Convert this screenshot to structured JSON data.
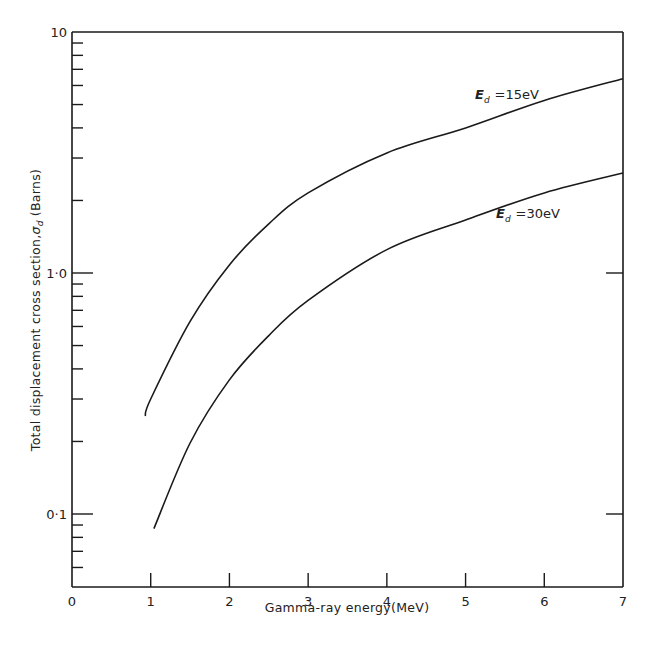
{
  "chart_data": {
    "type": "line",
    "title": "",
    "xlabel": "Gamma-ray energy(MeV)",
    "ylabel": "Total displacement cross section, σd (Barns)",
    "yscale": "log",
    "xlim": [
      0,
      7
    ],
    "ylim": [
      0.05,
      10
    ],
    "grid": false,
    "legend_position": "inline labels near curves (upper right)",
    "x_ticks": [
      "0",
      "1",
      "2",
      "3",
      "4",
      "5",
      "6",
      "7"
    ],
    "y_ticks": [
      "0·1",
      "1·0",
      "10"
    ],
    "series": [
      {
        "name": "Ed =15eV",
        "label_main": "E",
        "label_sub": "d",
        "label_rest": "=15eV",
        "points": [
          [
            0.93,
            0.255
          ],
          [
            1.0,
            0.3
          ],
          [
            1.5,
            0.63
          ],
          [
            2.0,
            1.08
          ],
          [
            2.5,
            1.6
          ],
          [
            3.0,
            2.15
          ],
          [
            4.0,
            3.15
          ],
          [
            5.0,
            4.0
          ],
          [
            6.0,
            5.2
          ],
          [
            7.0,
            6.4
          ]
        ]
      },
      {
        "name": "Ed =30eV",
        "label_main": "E",
        "label_sub": "d",
        "label_rest": "=30eV",
        "points": [
          [
            1.04,
            0.087
          ],
          [
            1.5,
            0.197
          ],
          [
            2.0,
            0.36
          ],
          [
            2.5,
            0.55
          ],
          [
            3.0,
            0.77
          ],
          [
            4.0,
            1.25
          ],
          [
            5.0,
            1.66
          ],
          [
            6.0,
            2.15
          ],
          [
            7.0,
            2.6
          ]
        ]
      }
    ]
  },
  "axes": {
    "x_title": "Gamma-ray energy(MeV)",
    "y_title_main": "Total displacement cross section,",
    "y_title_sigma": "σ",
    "y_title_sub": "d",
    "y_title_unit": "(Barns)",
    "x_tick_labels": [
      "0",
      "1",
      "2",
      "3",
      "4",
      "5",
      "6",
      "7"
    ],
    "y_tick_labels": {
      "top": "10",
      "mid": "1·0",
      "low": "0·1"
    }
  }
}
